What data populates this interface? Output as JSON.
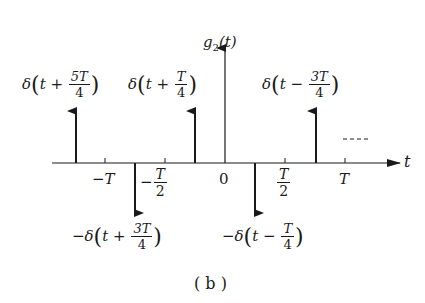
{
  "figure": {
    "y_axis_label": "g",
    "y_axis_sub": "2",
    "y_axis_arg": "(t)",
    "x_axis_label": "t",
    "caption": "( b )",
    "continuation": "----"
  },
  "ticks": [
    {
      "label": "−T",
      "pos": "-T"
    },
    {
      "label_num": "T",
      "label_den": "2",
      "sign": "−",
      "pos": "-T/2"
    },
    {
      "label": "0",
      "pos": "0"
    },
    {
      "label_num": "T",
      "label_den": "2",
      "sign": "",
      "pos": "T/2"
    },
    {
      "label": "T",
      "pos": "T"
    }
  ],
  "impulses": [
    {
      "pos": "-5T/4",
      "direction": "up",
      "label_prefix": "δ",
      "label_var": "t",
      "label_op": "+",
      "label_num": "5T",
      "label_den": "4"
    },
    {
      "pos": "-3T/4",
      "direction": "down",
      "label_prefix": "−δ",
      "label_var": "t",
      "label_op": "+",
      "label_num": "3T",
      "label_den": "4"
    },
    {
      "pos": "-T/4",
      "direction": "up",
      "label_prefix": "δ",
      "label_var": "t",
      "label_op": "+",
      "label_num": "T",
      "label_den": "4"
    },
    {
      "pos": "T/4",
      "direction": "down",
      "label_prefix": "−δ",
      "label_var": "t",
      "label_op": "−",
      "label_num": "T",
      "label_den": "4"
    },
    {
      "pos": "3T/4",
      "direction": "up",
      "label_prefix": "δ",
      "label_var": "t",
      "label_op": "−",
      "label_num": "3T",
      "label_den": "4"
    }
  ]
}
